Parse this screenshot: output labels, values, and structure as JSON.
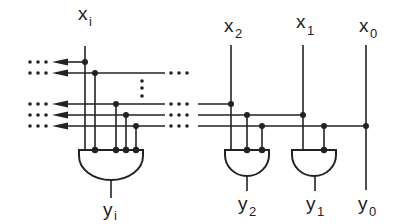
{
  "diagram": {
    "type": "logic-circuit",
    "inputs": [
      {
        "id": "xi",
        "base": "x",
        "sub": "i"
      },
      {
        "id": "x2",
        "base": "x",
        "sub": "2"
      },
      {
        "id": "x1",
        "base": "x",
        "sub": "1"
      },
      {
        "id": "x0",
        "base": "x",
        "sub": "0"
      }
    ],
    "outputs": [
      {
        "id": "yi",
        "base": "y",
        "sub": "i"
      },
      {
        "id": "y2",
        "base": "y",
        "sub": "2"
      },
      {
        "id": "y1",
        "base": "y",
        "sub": "1"
      },
      {
        "id": "y0",
        "base": "y",
        "sub": "0"
      }
    ],
    "gates": [
      {
        "id": "and-i",
        "type": "AND",
        "output": "yi"
      },
      {
        "id": "and-2",
        "type": "AND",
        "inputs": [
          "x2",
          "x1",
          "x0"
        ],
        "output": "y2"
      },
      {
        "id": "and-1",
        "type": "AND",
        "inputs": [
          "x1",
          "x0"
        ],
        "output": "y1"
      }
    ],
    "ellipsis": "⋮",
    "dots": "•••"
  }
}
